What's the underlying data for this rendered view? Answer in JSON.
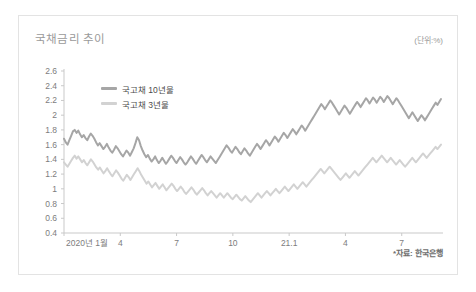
{
  "card": {
    "title": "국채금리 추이",
    "unit": "(단위:%)",
    "source": "*자료: 한국은행"
  },
  "chart_data": {
    "type": "line",
    "title": "국채금리 추이",
    "subtitle": "",
    "xlabel": "",
    "ylabel": "",
    "unit": "%",
    "grid": false,
    "legend_position": "top-left",
    "ylim": [
      0.4,
      2.6
    ],
    "ytick_step": 0.2,
    "yticks": [
      "2.6",
      "2.4",
      "2.2",
      "2",
      "1.8",
      "1.6",
      "1.4",
      "1.2",
      "1",
      "0.8",
      "0.6",
      "0.4"
    ],
    "ytick_values": [
      2.6,
      2.4,
      2.2,
      2.0,
      1.8,
      1.6,
      1.4,
      1.2,
      1.0,
      0.8,
      0.6,
      0.4
    ],
    "xtick_labels": [
      "2020년 1월",
      "4",
      "7",
      "10",
      "21.1",
      "4",
      "7"
    ],
    "xtick_positions": [
      0,
      3,
      6,
      9,
      12,
      15,
      18
    ],
    "xlim": [
      0,
      20.2
    ],
    "source": "*자료: 한국은행",
    "legend": [
      "국고채 10년물",
      "국고채 3년물"
    ],
    "colors": {
      "series_10y": "#a6a6a6",
      "series_3y": "#d2d2d2",
      "axis": "#c9c9c9",
      "text": "#7d7d7d",
      "title": "#9a9a9a",
      "card_border": "#e3e3e3"
    },
    "series": [
      {
        "name": "국고채 10년물",
        "color": "#a6a6a6",
        "values": [
          1.68,
          1.63,
          1.6,
          1.66,
          1.72,
          1.78,
          1.8,
          1.76,
          1.79,
          1.74,
          1.7,
          1.73,
          1.69,
          1.66,
          1.71,
          1.75,
          1.72,
          1.68,
          1.63,
          1.59,
          1.62,
          1.58,
          1.54,
          1.57,
          1.61,
          1.56,
          1.52,
          1.49,
          1.53,
          1.58,
          1.55,
          1.51,
          1.47,
          1.44,
          1.48,
          1.52,
          1.49,
          1.45,
          1.5,
          1.55,
          1.62,
          1.7,
          1.66,
          1.58,
          1.52,
          1.47,
          1.43,
          1.46,
          1.41,
          1.37,
          1.4,
          1.44,
          1.39,
          1.35,
          1.38,
          1.42,
          1.38,
          1.34,
          1.37,
          1.41,
          1.45,
          1.42,
          1.38,
          1.35,
          1.39,
          1.43,
          1.4,
          1.36,
          1.33,
          1.36,
          1.4,
          1.44,
          1.41,
          1.37,
          1.34,
          1.38,
          1.42,
          1.46,
          1.43,
          1.39,
          1.36,
          1.4,
          1.44,
          1.41,
          1.38,
          1.35,
          1.39,
          1.43,
          1.47,
          1.51,
          1.55,
          1.59,
          1.56,
          1.52,
          1.49,
          1.53,
          1.57,
          1.54,
          1.5,
          1.47,
          1.51,
          1.55,
          1.52,
          1.48,
          1.45,
          1.49,
          1.53,
          1.57,
          1.61,
          1.58,
          1.54,
          1.58,
          1.62,
          1.66,
          1.63,
          1.59,
          1.63,
          1.67,
          1.71,
          1.68,
          1.64,
          1.68,
          1.72,
          1.76,
          1.73,
          1.69,
          1.73,
          1.77,
          1.81,
          1.78,
          1.74,
          1.78,
          1.82,
          1.86,
          1.83,
          1.79,
          1.83,
          1.87,
          1.91,
          1.95,
          1.99,
          2.03,
          2.07,
          2.11,
          2.15,
          2.12,
          2.08,
          2.12,
          2.16,
          2.2,
          2.17,
          2.13,
          2.09,
          2.05,
          2.01,
          2.05,
          2.09,
          2.13,
          2.1,
          2.06,
          2.02,
          2.06,
          2.1,
          2.14,
          2.18,
          2.15,
          2.11,
          2.15,
          2.19,
          2.23,
          2.2,
          2.16,
          2.2,
          2.24,
          2.21,
          2.17,
          2.21,
          2.25,
          2.22,
          2.18,
          2.22,
          2.26,
          2.23,
          2.19,
          2.15,
          2.19,
          2.23,
          2.2,
          2.16,
          2.12,
          2.08,
          2.04,
          2.0,
          1.96,
          2.0,
          2.04,
          2.0,
          1.96,
          1.92,
          1.96,
          2.0,
          1.97,
          1.93,
          1.97,
          2.01,
          2.05,
          2.09,
          2.13,
          2.17,
          2.14,
          2.18,
          2.22
        ]
      },
      {
        "name": "국고채 3년물",
        "color": "#d2d2d2",
        "values": [
          1.36,
          1.33,
          1.3,
          1.34,
          1.38,
          1.42,
          1.45,
          1.41,
          1.44,
          1.4,
          1.36,
          1.39,
          1.35,
          1.32,
          1.36,
          1.4,
          1.37,
          1.33,
          1.29,
          1.26,
          1.29,
          1.25,
          1.21,
          1.24,
          1.28,
          1.24,
          1.2,
          1.17,
          1.21,
          1.25,
          1.22,
          1.18,
          1.14,
          1.11,
          1.15,
          1.19,
          1.16,
          1.12,
          1.16,
          1.2,
          1.24,
          1.28,
          1.24,
          1.19,
          1.15,
          1.11,
          1.07,
          1.1,
          1.06,
          1.02,
          1.05,
          1.08,
          1.04,
          1.0,
          1.03,
          1.06,
          1.02,
          0.98,
          1.01,
          1.04,
          1.07,
          1.04,
          1.0,
          0.97,
          1.0,
          1.03,
          1.0,
          0.96,
          0.93,
          0.96,
          0.99,
          1.02,
          0.99,
          0.95,
          0.92,
          0.95,
          0.98,
          1.01,
          0.98,
          0.94,
          0.91,
          0.94,
          0.97,
          0.94,
          0.91,
          0.88,
          0.91,
          0.94,
          0.91,
          0.88,
          0.91,
          0.94,
          0.91,
          0.88,
          0.86,
          0.89,
          0.92,
          0.89,
          0.86,
          0.84,
          0.87,
          0.9,
          0.87,
          0.84,
          0.82,
          0.85,
          0.88,
          0.91,
          0.94,
          0.91,
          0.88,
          0.91,
          0.94,
          0.97,
          0.94,
          0.91,
          0.94,
          0.97,
          1.0,
          0.97,
          0.94,
          0.97,
          1.0,
          1.03,
          1.0,
          0.97,
          1.0,
          1.03,
          1.06,
          1.03,
          1.0,
          1.03,
          1.06,
          1.09,
          1.06,
          1.03,
          1.06,
          1.09,
          1.12,
          1.15,
          1.18,
          1.21,
          1.24,
          1.27,
          1.24,
          1.21,
          1.24,
          1.27,
          1.3,
          1.27,
          1.24,
          1.21,
          1.18,
          1.15,
          1.12,
          1.15,
          1.18,
          1.21,
          1.18,
          1.15,
          1.18,
          1.21,
          1.24,
          1.21,
          1.18,
          1.21,
          1.24,
          1.27,
          1.3,
          1.33,
          1.36,
          1.39,
          1.42,
          1.39,
          1.36,
          1.39,
          1.42,
          1.45,
          1.42,
          1.39,
          1.36,
          1.39,
          1.42,
          1.39,
          1.36,
          1.33,
          1.36,
          1.39,
          1.36,
          1.33,
          1.3,
          1.33,
          1.36,
          1.39,
          1.42,
          1.39,
          1.36,
          1.39,
          1.42,
          1.45,
          1.48,
          1.45,
          1.42,
          1.45,
          1.48,
          1.51,
          1.54,
          1.57,
          1.54,
          1.57,
          1.6
        ]
      }
    ]
  }
}
